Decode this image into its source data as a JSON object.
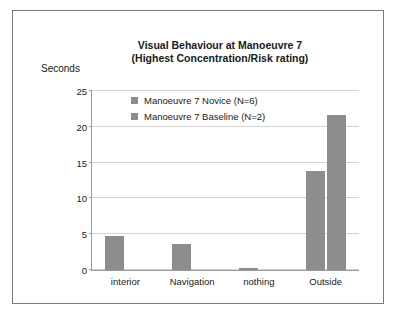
{
  "chart_data": {
    "type": "bar",
    "title": "Visual Behaviour at Manoeuvre 7 (Highest Concentration/Risk rating)",
    "title_line1": "Visual Behaviour at Manoeuvre 7",
    "title_line2": "(Highest Concentration/Risk rating)",
    "xlabel": "",
    "ylabel": "Seconds",
    "categories": [
      "interior",
      "Navigation",
      "nothing",
      "Outside"
    ],
    "series": [
      {
        "name": "Manoeuvre 7 Novice (N=6)",
        "values": [
          4.8,
          3.6,
          0.3,
          13.8
        ]
      },
      {
        "name": "Manoeuvre 7 Baseline (N=2)",
        "values": [
          0,
          0,
          0,
          21.6
        ]
      }
    ],
    "ylim": [
      0,
      25
    ],
    "yticks": [
      0,
      5,
      10,
      15,
      20,
      25
    ],
    "ytick_labels": [
      "0",
      "5",
      "10",
      "15",
      "20",
      "25"
    ],
    "grid": true,
    "legend_position": "top-center",
    "bar_color": "#8d8d8d",
    "frame_color": "#7a7a7a",
    "axis_color": "#9a9a9a",
    "grid_color": "#d4d4d4"
  }
}
